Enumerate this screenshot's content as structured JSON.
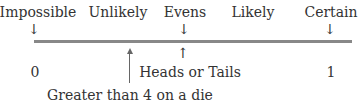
{
  "scale": {
    "top_labels": [
      "Impossible",
      "Unlikely",
      "Evens",
      "Likely",
      "Certain"
    ],
    "bottom_values": {
      "left": "0",
      "right": "1"
    },
    "line_color": "#888888"
  },
  "events": [
    {
      "label": "Heads or Tails",
      "position": 0.5
    },
    {
      "label": "Greater than 4 on a die",
      "position": 0.33
    }
  ],
  "glyphs": {
    "down_arrow": "↓",
    "up_arrow": "↑"
  }
}
